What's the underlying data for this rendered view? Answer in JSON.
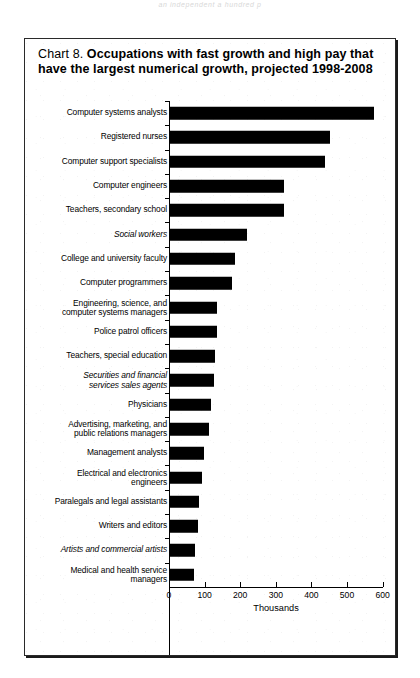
{
  "page": {
    "running_head": "an independent a hundred p"
  },
  "figure": {
    "chart_number": "Chart 8.",
    "title": "Occupations with fast growth and high pay that have the largest numerical growth, projected 1998-2008"
  },
  "axis": {
    "x_title": "Thousands",
    "x_ticks": [
      "0",
      "100",
      "200",
      "300",
      "400",
      "500",
      "600"
    ]
  },
  "chart_data": {
    "type": "bar",
    "orientation": "horizontal",
    "title": "Chart 8. Occupations with fast growth and high pay that have the largest numerical growth, projected 1998-2008",
    "xlabel": "Thousands",
    "ylabel": "",
    "xlim": [
      0,
      600
    ],
    "grid": false,
    "legend": null,
    "categories": [
      "Computer systems analysts",
      "Registered nurses",
      "Computer support specialists",
      "Computer engineers",
      "Teachers, secondary school",
      "Social workers",
      "College and university faculty",
      "Computer programmers",
      "Engineering, science, and computer systems managers",
      "Police patrol officers",
      "Teachers, special education",
      "Securities and financial services sales agents",
      "Physicians",
      "Advertising, marketing, and public relations managers",
      "Management analysts",
      "Electrical and electronics engineers",
      "Paralegals and legal assistants",
      "Writers and editors",
      "Artists and commercial artists",
      "Medical and health service managers"
    ],
    "values": [
      577,
      451,
      439,
      323,
      322,
      218,
      184,
      178,
      136,
      134,
      130,
      125,
      118,
      113,
      98,
      93,
      84,
      82,
      74,
      70
    ]
  },
  "labels": [
    {
      "text": "Computer systems analysts",
      "italic": false,
      "value": 577
    },
    {
      "text": "Registered nurses",
      "italic": false,
      "value": 451
    },
    {
      "text": "Computer support specialists",
      "italic": false,
      "value": 439
    },
    {
      "text": "Computer engineers",
      "italic": false,
      "value": 323
    },
    {
      "text": "Teachers, secondary school",
      "italic": false,
      "value": 322
    },
    {
      "text": "Social workers",
      "italic": true,
      "value": 218
    },
    {
      "text": "College and university faculty",
      "italic": false,
      "value": 184
    },
    {
      "text": "Computer programmers",
      "italic": false,
      "value": 178
    },
    {
      "text": "Engineering, science, and\ncomputer systems managers",
      "italic": false,
      "value": 136
    },
    {
      "text": "Police patrol officers",
      "italic": false,
      "value": 134
    },
    {
      "text": "Teachers, special education",
      "italic": false,
      "value": 130
    },
    {
      "text": "Securities and financial\nservices sales agents",
      "italic": true,
      "value": 125
    },
    {
      "text": "Physicians",
      "italic": false,
      "value": 118
    },
    {
      "text": "Advertising, marketing, and\npublic relations managers",
      "italic": false,
      "value": 113
    },
    {
      "text": "Management analysts",
      "italic": false,
      "value": 98
    },
    {
      "text": "Electrical and electronics\nengineers",
      "italic": false,
      "value": 93
    },
    {
      "text": "Paralegals and legal assistants",
      "italic": false,
      "value": 84
    },
    {
      "text": "Writers and editors",
      "italic": false,
      "value": 82
    },
    {
      "text": "Artists and commercial artists",
      "italic": true,
      "value": 74
    },
    {
      "text": "Medical and health service\nmanagers",
      "italic": false,
      "value": 70
    }
  ]
}
